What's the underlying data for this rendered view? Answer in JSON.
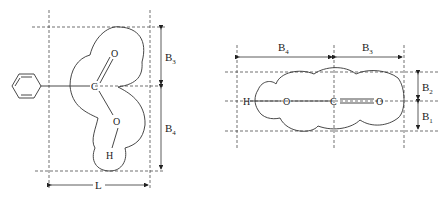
{
  "left_diagram": {
    "atoms": {
      "carbon": "C",
      "oxygen_double": "O",
      "oxygen_single": "O",
      "hydrogen": "H"
    },
    "labels": {
      "top_dim": {
        "base": "B",
        "sub": "3"
      },
      "bottom_dim": {
        "base": "B",
        "sub": "4"
      },
      "width_dim": "L"
    },
    "substituent": "phenyl ring"
  },
  "right_diagram": {
    "atoms": {
      "hydrogen": "H",
      "oxygen_single": "O",
      "carbon": "C",
      "oxygen_double": "O"
    },
    "labels": {
      "left_dim": {
        "base": "B",
        "sub": "4"
      },
      "right_dim": {
        "base": "B",
        "sub": "3"
      },
      "upper_dim": {
        "base": "B",
        "sub": "2"
      },
      "lower_dim": {
        "base": "B",
        "sub": "1"
      }
    }
  },
  "colors": {
    "line": "#333333",
    "background": "#ffffff"
  }
}
